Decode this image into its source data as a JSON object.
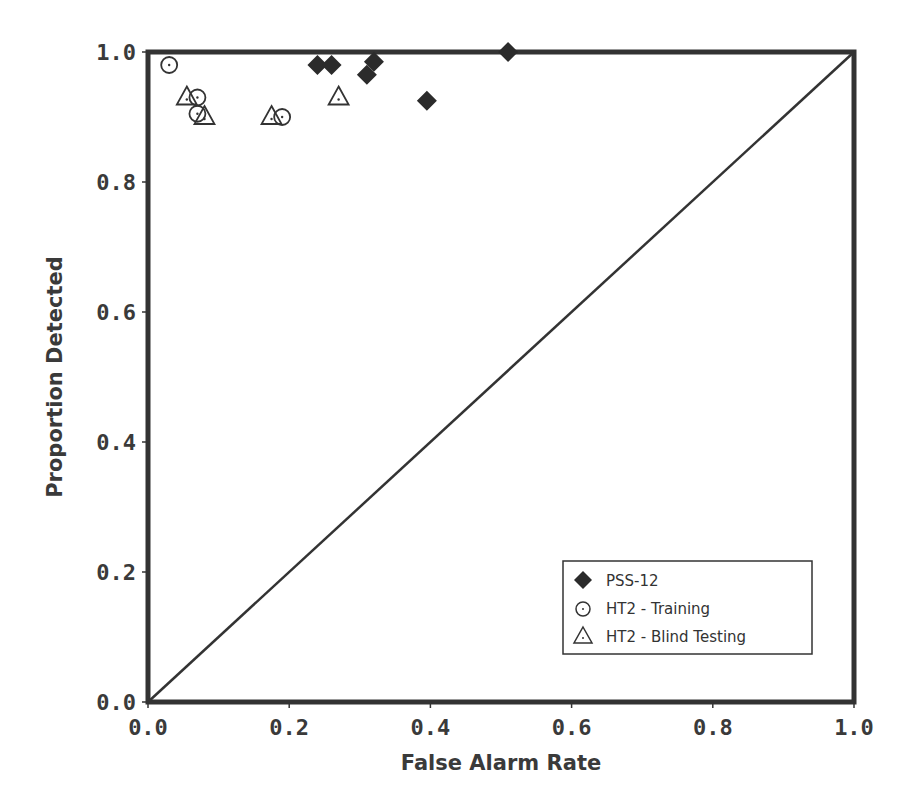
{
  "chart_data": {
    "type": "scatter",
    "title": "",
    "xlabel": "False Alarm Rate",
    "ylabel": "Proportion Detected",
    "xlim": [
      0.0,
      1.0
    ],
    "ylim": [
      0.0,
      1.0
    ],
    "xticks": [
      "0.0",
      "0.2",
      "0.4",
      "0.6",
      "0.8",
      "1.0"
    ],
    "yticks": [
      "0.0",
      "0.2",
      "0.4",
      "0.6",
      "0.8",
      "1.0"
    ],
    "grid": false,
    "legend_position": "lower right",
    "reference_line": {
      "from": [
        0,
        0
      ],
      "to": [
        1,
        1
      ],
      "label": "chance diagonal"
    },
    "series": [
      {
        "name": "PSS-12",
        "marker": "filled-diamond",
        "points": [
          {
            "x": 0.24,
            "y": 0.98
          },
          {
            "x": 0.26,
            "y": 0.98
          },
          {
            "x": 0.31,
            "y": 0.965
          },
          {
            "x": 0.32,
            "y": 0.985
          },
          {
            "x": 0.395,
            "y": 0.925
          },
          {
            "x": 0.51,
            "y": 1.0
          }
        ]
      },
      {
        "name": "HT2 - Training",
        "marker": "open-circle",
        "points": [
          {
            "x": 0.03,
            "y": 0.98
          },
          {
            "x": 0.07,
            "y": 0.93
          },
          {
            "x": 0.07,
            "y": 0.905
          },
          {
            "x": 0.19,
            "y": 0.9
          }
        ]
      },
      {
        "name": "HT2 - Blind Testing",
        "marker": "open-triangle",
        "points": [
          {
            "x": 0.055,
            "y": 0.93
          },
          {
            "x": 0.08,
            "y": 0.9
          },
          {
            "x": 0.175,
            "y": 0.9
          },
          {
            "x": 0.27,
            "y": 0.93
          }
        ]
      }
    ]
  },
  "legend": {
    "items": [
      {
        "label": "PSS-12"
      },
      {
        "label": "HT2 - Training"
      },
      {
        "label": "HT2 - Blind Testing"
      }
    ]
  },
  "colors": {
    "axis": "#333333",
    "marker_fill": "#2b2b2b",
    "text": "#3a3a3a"
  }
}
